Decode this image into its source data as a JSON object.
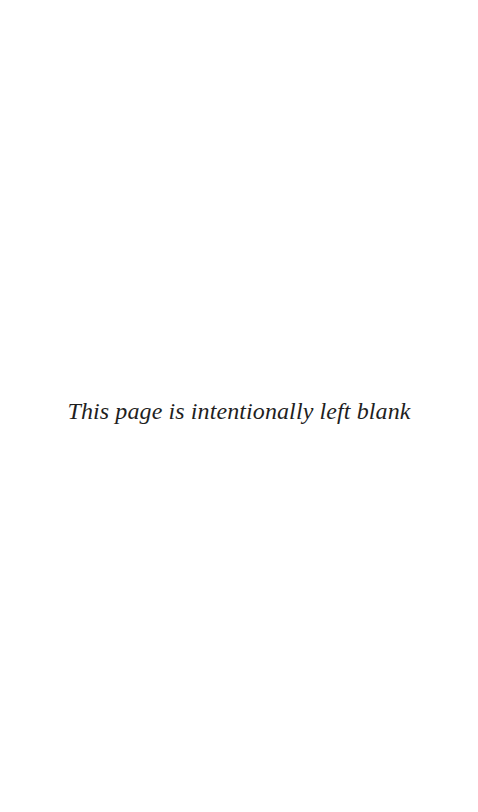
{
  "page": {
    "background_color": "#ffffff",
    "width": 478,
    "height": 812
  },
  "notice": {
    "text": "This page is intentionally left blank",
    "color": "#1f1f1f",
    "style": "italic-serif",
    "alignment": "center"
  }
}
